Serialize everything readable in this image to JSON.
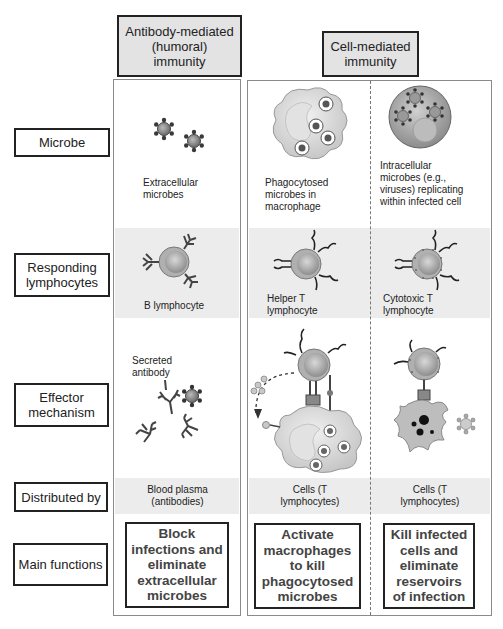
{
  "headers": {
    "humoral": "Antibody-mediated (humoral) immunity",
    "cell_mediated": "Cell-mediated immunity"
  },
  "row_labels": [
    "Microbe",
    "Responding lymphocytes",
    "Effector mechanism",
    "Distributed by",
    "Main functions"
  ],
  "columns": [
    {
      "id": "humoral",
      "microbe_caption": "Extracellular microbes",
      "lymphocyte_caption": "B lymphocyte",
      "effector_caption": "Secreted antibody",
      "distributed_by": "Blood plasma (antibodies)",
      "main_function": "Block infections and eliminate extracellular microbes"
    },
    {
      "id": "helper",
      "microbe_caption": "Phagocytosed microbes in macrophage",
      "lymphocyte_caption": "Helper T lymphocyte",
      "distributed_by": "Cells (T lymphocytes)",
      "main_function": "Activate macrophages to kill phagocytosed microbes"
    },
    {
      "id": "cytotoxic",
      "microbe_caption": "Intracellular microbes (e.g., viruses) replicating within infected cell",
      "lymphocyte_caption": "Cytotoxic T lymphocyte",
      "distributed_by": "Cells (T lymphocytes)",
      "main_function": "Kill infected cells and eliminate reservoirs of infection"
    }
  ],
  "colors": {
    "header_fill": "#e3e3e3",
    "band_fill": "#ececec",
    "cell_fill": "#d9d9d9",
    "microbe_dark": "#3a3a3a"
  }
}
